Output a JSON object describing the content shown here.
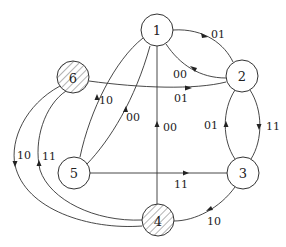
{
  "diagram": {
    "type": "state-transition-graph",
    "nodes": [
      {
        "id": "1",
        "label": "1",
        "hatched": false
      },
      {
        "id": "2",
        "label": "2",
        "hatched": false
      },
      {
        "id": "3",
        "label": "3",
        "hatched": false
      },
      {
        "id": "4",
        "label": "4",
        "hatched": true
      },
      {
        "id": "5",
        "label": "5",
        "hatched": false
      },
      {
        "id": "6",
        "label": "6",
        "hatched": true
      }
    ],
    "edges": [
      {
        "from": "1",
        "to": "2",
        "label": "01"
      },
      {
        "from": "2",
        "to": "1",
        "label": "00"
      },
      {
        "from": "6",
        "to": "2",
        "label": "01"
      },
      {
        "from": "1",
        "to": "5",
        "label": "10"
      },
      {
        "from": "5",
        "to": "1",
        "label": "00"
      },
      {
        "from": "4",
        "to": "1",
        "label": "00"
      },
      {
        "from": "3",
        "to": "2",
        "label": "01"
      },
      {
        "from": "2",
        "to": "3",
        "label": "11"
      },
      {
        "from": "5",
        "to": "3",
        "label": "11"
      },
      {
        "from": "3",
        "to": "4",
        "label": "10"
      },
      {
        "from": "6",
        "to": "4",
        "label": "10"
      },
      {
        "from": "4",
        "to": "6",
        "label": "11"
      }
    ]
  }
}
